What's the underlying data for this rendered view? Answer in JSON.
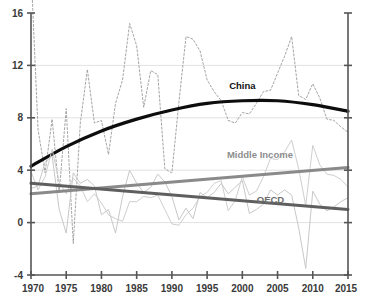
{
  "chart_data": {
    "type": "line",
    "title": "",
    "subtitle": "",
    "xlabel": "",
    "ylabel": "",
    "xlim": [
      1970,
      2015
    ],
    "ylim": [
      -4,
      16
    ],
    "grid": true,
    "gridlines_y": [
      0,
      4,
      8,
      12
    ],
    "legend_position": "inline-annotations",
    "y_ticks": [
      -4,
      0,
      4,
      8,
      12,
      16
    ],
    "y_tick_labels": [
      "-4",
      "0",
      "4",
      "8",
      "12",
      "16"
    ],
    "x_ticks": [
      1970,
      1975,
      1980,
      1985,
      1990,
      1995,
      2000,
      2005,
      2010,
      2015
    ],
    "x_tick_labels": [
      "1970",
      "1975",
      "1980",
      "1985",
      "1990",
      "1995",
      "2000",
      "2005",
      "2010",
      "2015"
    ],
    "annotations": [
      {
        "text": "China",
        "x": 2000,
        "y": 10.2,
        "color": "#111111"
      },
      {
        "text": "Middle Income",
        "x": 2002.5,
        "y": 4.9,
        "color": "#8e8e8e"
      },
      {
        "text": "OECD",
        "x": 2004,
        "y": 1.5,
        "color": "#6d6d6d"
      }
    ],
    "series": [
      {
        "name": "China (actual)",
        "style": "dashed",
        "color": "#9a9a9a",
        "width": 0.9,
        "x": [
          1970,
          1971,
          1972,
          1973,
          1974,
          1975,
          1976,
          1977,
          1978,
          1979,
          1980,
          1981,
          1982,
          1983,
          1984,
          1985,
          1986,
          1987,
          1988,
          1989,
          1990,
          1991,
          1992,
          1993,
          1994,
          1995,
          1996,
          1997,
          1998,
          1999,
          2000,
          2001,
          2002,
          2003,
          2004,
          2005,
          2006,
          2007,
          2008,
          2009,
          2010,
          2011,
          2012,
          2013,
          2014,
          2015
        ],
        "values": [
          19.4,
          7.1,
          3.8,
          7.9,
          2.3,
          8.7,
          -1.6,
          7.6,
          11.7,
          7.6,
          7.8,
          5.2,
          9.1,
          10.9,
          15.2,
          13.5,
          8.8,
          11.6,
          11.3,
          4.1,
          3.8,
          9.2,
          14.2,
          14.0,
          13.1,
          10.9,
          10.0,
          9.3,
          7.8,
          7.6,
          8.4,
          8.3,
          9.1,
          10.0,
          10.1,
          11.4,
          12.7,
          14.2,
          9.7,
          9.4,
          10.6,
          9.5,
          7.9,
          7.8,
          7.3,
          6.9
        ]
      },
      {
        "name": "China (trend)",
        "style": "solid",
        "color": "#0d0d0d",
        "width": 3.2,
        "x": [
          1970,
          1975,
          1980,
          1985,
          1990,
          1995,
          2000,
          2005,
          2010,
          2015
        ],
        "values": [
          4.3,
          5.8,
          7.0,
          7.9,
          8.6,
          9.1,
          9.3,
          9.3,
          9.0,
          8.5
        ]
      },
      {
        "name": "Middle Income (actual)",
        "style": "solid",
        "color": "#cfcfcf",
        "width": 1.0,
        "x": [
          1970,
          1971,
          1972,
          1973,
          1974,
          1975,
          1976,
          1977,
          1978,
          1979,
          1980,
          1981,
          1982,
          1983,
          1984,
          1985,
          1986,
          1987,
          1988,
          1989,
          1990,
          1991,
          1992,
          1993,
          1994,
          1995,
          1996,
          1997,
          1998,
          1999,
          2000,
          2001,
          2002,
          2003,
          2004,
          2005,
          2006,
          2007,
          2008,
          2009,
          2010,
          2011,
          2012,
          2013,
          2014,
          2015
        ],
        "values": [
          3.9,
          2.5,
          3.5,
          5.6,
          3.1,
          2.2,
          3.4,
          2.8,
          1.6,
          2.2,
          1.5,
          0.6,
          0.3,
          0.1,
          1.6,
          1.6,
          2.0,
          1.9,
          2.1,
          1.0,
          -0.1,
          -0.2,
          0.6,
          1.1,
          2.0,
          2.3,
          3.0,
          3.2,
          0.9,
          1.7,
          3.5,
          2.1,
          2.4,
          3.5,
          4.9,
          4.8,
          5.4,
          6.3,
          4.1,
          1.3,
          5.9,
          4.4,
          3.7,
          3.6,
          3.3,
          2.7
        ]
      },
      {
        "name": "OECD (actual)",
        "style": "solid",
        "color": "#c8c8c8",
        "width": 1.0,
        "x": [
          1970,
          1971,
          1972,
          1973,
          1974,
          1975,
          1976,
          1977,
          1978,
          1979,
          1980,
          1981,
          1982,
          1983,
          1984,
          1985,
          1986,
          1987,
          1988,
          1989,
          1990,
          1991,
          1992,
          1993,
          1994,
          1995,
          1996,
          1997,
          1998,
          1999,
          2000,
          2001,
          2002,
          2003,
          2004,
          2005,
          2006,
          2007,
          2008,
          2009,
          2010,
          2011,
          2012,
          2013,
          2014,
          2015
        ],
        "values": [
          2.6,
          2.8,
          4.6,
          5.1,
          1.0,
          -0.8,
          3.8,
          3.0,
          3.3,
          2.8,
          0.6,
          1.0,
          -0.8,
          2.0,
          4.0,
          3.0,
          2.3,
          2.7,
          3.7,
          3.1,
          2.0,
          0.2,
          1.1,
          0.3,
          2.3,
          1.9,
          2.3,
          3.0,
          2.2,
          2.7,
          3.2,
          0.7,
          1.0,
          1.4,
          2.5,
          2.1,
          2.5,
          2.1,
          -0.4,
          -3.5,
          2.4,
          1.4,
          0.9,
          1.2,
          1.6,
          1.9
        ]
      },
      {
        "name": "Middle Income (trend)",
        "style": "solid",
        "color": "#8a8a8a",
        "width": 3.0,
        "x": [
          1970,
          2015
        ],
        "values": [
          2.2,
          4.2
        ]
      },
      {
        "name": "OECD (trend)",
        "style": "solid",
        "color": "#5f5f5f",
        "width": 3.0,
        "x": [
          1970,
          2015
        ],
        "values": [
          3.0,
          1.0
        ]
      }
    ]
  }
}
